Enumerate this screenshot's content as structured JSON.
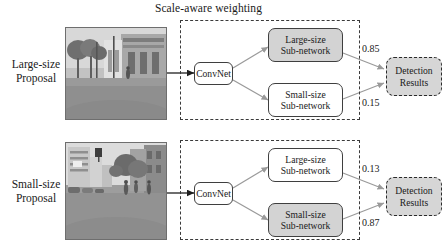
{
  "figure": {
    "title": "Scale-aware weighting"
  },
  "rows": [
    {
      "id": "large-size-row",
      "label_line1": "Large-size",
      "label_line2": "Proposal",
      "photo_alt": "street-scene-large-proposal",
      "convnet_label": "ConvNet",
      "branches": [
        {
          "id": "large-size-sub-network",
          "line1": "Large-size",
          "line2": "Sub-network",
          "highlighted": true,
          "weight": "0.85"
        },
        {
          "id": "small-size-sub-network",
          "line1": "Small-size",
          "line2": "Sub-network",
          "highlighted": false,
          "weight": "0.15"
        }
      ],
      "result_line1": "Detection",
      "result_line2": "Results"
    },
    {
      "id": "small-size-row",
      "label_line1": "Small-size",
      "label_line2": "Proposal",
      "photo_alt": "street-scene-small-proposal",
      "convnet_label": "ConvNet",
      "branches": [
        {
          "id": "large-size-sub-network",
          "line1": "Large-size",
          "line2": "Sub-network",
          "highlighted": false,
          "weight": "0.13"
        },
        {
          "id": "small-size-sub-network",
          "line1": "Small-size",
          "line2": "Sub-network",
          "highlighted": true,
          "weight": "0.87"
        }
      ],
      "result_line1": "Detection",
      "result_line2": "Results"
    }
  ],
  "colors": {
    "highlight_fill": "#d3d3d3",
    "plain_fill": "#ffffff",
    "result_fill": "#d6d6d6",
    "stroke": "#3f3f3f",
    "dashed_stroke": "#3a3a3a",
    "connector": "#8a8a8a",
    "text": "#1a1a1a"
  }
}
